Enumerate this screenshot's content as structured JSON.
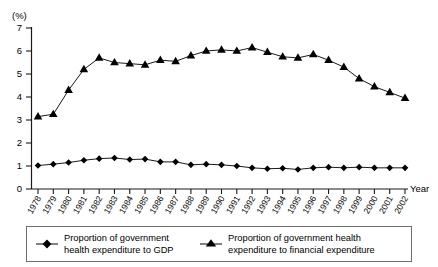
{
  "chart_data": {
    "type": "line",
    "title": "",
    "xlabel": "Year",
    "ylabel": "(%)",
    "ylim": [
      0,
      7
    ],
    "yticks": [
      0,
      1,
      2,
      3,
      4,
      5,
      6,
      7
    ],
    "grid": false,
    "legend_position": "bottom",
    "categories": [
      "1978",
      "1979",
      "1980",
      "1981",
      "1982",
      "1983",
      "1984",
      "1985",
      "1986",
      "1987",
      "1988",
      "1989",
      "1990",
      "1991",
      "1992",
      "1993",
      "1994",
      "1995",
      "1996",
      "1997",
      "1998",
      "1999",
      "2000",
      "2001",
      "2002"
    ],
    "series": [
      {
        "name": "Proportion of government health expenditure to GDP",
        "marker": "diamond",
        "values": [
          1.02,
          1.08,
          1.15,
          1.25,
          1.32,
          1.35,
          1.28,
          1.3,
          1.18,
          1.18,
          1.05,
          1.08,
          1.05,
          1.0,
          0.92,
          0.88,
          0.9,
          0.85,
          0.92,
          0.95,
          0.92,
          0.95,
          0.92,
          0.92,
          0.92
        ]
      },
      {
        "name": "Proportion of government health expenditure to financial expenditure",
        "marker": "triangle",
        "values": [
          3.15,
          3.25,
          4.3,
          5.2,
          5.7,
          5.5,
          5.45,
          5.4,
          5.6,
          5.55,
          5.8,
          6.0,
          6.05,
          6.0,
          6.15,
          5.95,
          5.75,
          5.7,
          5.85,
          5.6,
          5.3,
          4.8,
          4.45,
          4.2,
          3.95
        ]
      }
    ]
  },
  "legend": {
    "entries": [
      {
        "line1": "Proportion of government",
        "line2": "health expenditure to GDP",
        "marker": "diamond"
      },
      {
        "line1": "Proportion of government health",
        "line2": "expenditure to financial expenditure",
        "marker": "triangle"
      }
    ]
  },
  "axis": {
    "unit": "(%)",
    "x_axis_title": "Year"
  },
  "colors": {
    "ink": "#1a1a1a",
    "legend_border": "#6e6e6e",
    "background": "#ffffff"
  }
}
